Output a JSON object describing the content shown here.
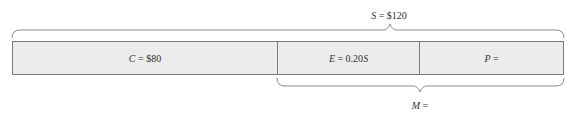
{
  "top_brace": {
    "var": "S",
    "text": " = $120"
  },
  "bar": {
    "segments": [
      {
        "var": "C",
        "text": " = $80",
        "width": 264
      },
      {
        "var": "E",
        "text": " = 0.20",
        "suffix_var": "S",
        "width": 142
      },
      {
        "var": "P",
        "text": " =",
        "width": 146
      }
    ]
  },
  "bottom_brace": {
    "var": "M",
    "text": " ="
  },
  "colors": {
    "bar_fill": "#ececec",
    "stroke": "#7a7a7a",
    "text": "#333333"
  }
}
